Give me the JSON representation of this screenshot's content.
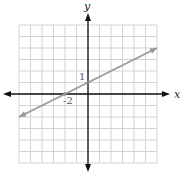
{
  "chart_data": {
    "type": "line",
    "title": "",
    "xlabel": "x",
    "ylabel": "y",
    "xlim": [
      -6,
      6
    ],
    "ylim": [
      -6,
      6
    ],
    "grid": true,
    "series": [
      {
        "name": "y = x/2 + 1",
        "equation": "y = 0.5x + 1",
        "slope": 0.5,
        "intercept": 1,
        "x": [
          -6,
          6
        ],
        "y": [
          -2,
          4
        ],
        "color": "#999999",
        "arrows": "both"
      }
    ],
    "annotations": [
      {
        "text": "1",
        "x": 0,
        "y": 1,
        "meaning": "y-intercept"
      },
      {
        "text": "-2",
        "x": -2,
        "y": 0,
        "meaning": "x-intercept"
      }
    ]
  },
  "labels": {
    "x_axis": "x",
    "y_axis": "y",
    "y_intercept": "1",
    "x_intercept": "-2"
  },
  "colors": {
    "grid": "#d4d4d4",
    "axes": "#111111",
    "line": "#999999"
  }
}
